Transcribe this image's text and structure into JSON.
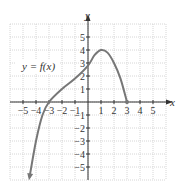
{
  "chart_data": {
    "type": "line",
    "title": "",
    "xlabel": "x",
    "ylabel": "y",
    "xlim": [
      -6,
      6
    ],
    "ylim": [
      -6,
      6
    ],
    "grid": true,
    "x_ticks": [
      "-5",
      "-4",
      "-3",
      "-2",
      "-1",
      "1",
      "2",
      "3",
      "4",
      "5"
    ],
    "y_ticks": [
      "5",
      "4",
      "3",
      "2",
      "1",
      "-1",
      "-2",
      "-3",
      "-4",
      "-5"
    ],
    "annotations": [
      "y = f(x)"
    ],
    "series": [
      {
        "name": "y = f(x)",
        "x": [
          -4.5,
          -4,
          -3.5,
          -3,
          -2,
          -1,
          0,
          0.5,
          1,
          1.5,
          2,
          2.5,
          3
        ],
        "y": [
          -5.8,
          -3,
          -1,
          0,
          1,
          1.8,
          2.8,
          3.6,
          4,
          3.8,
          3,
          1.8,
          0
        ],
        "left_end": "arrow",
        "right_end": "closed-dot",
        "right_end_point": [
          3,
          0
        ],
        "maximum": [
          1,
          4
        ],
        "color": "#777777"
      }
    ]
  },
  "labels": {
    "x_axis": "x",
    "y_axis": "y",
    "function": "y = f(x)"
  },
  "colors": {
    "grid": "#cccccc",
    "axis": "#333333",
    "curve": "#7a7a7a"
  }
}
